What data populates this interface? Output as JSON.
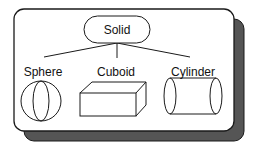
{
  "diagram": {
    "root": {
      "label": "Solid"
    },
    "children": [
      {
        "label": "Sphere",
        "shape": "sphere-icon"
      },
      {
        "label": "Cuboid",
        "shape": "cuboid-icon"
      },
      {
        "label": "Cylinder",
        "shape": "cylinder-icon"
      }
    ]
  },
  "colors": {
    "stroke": "#1a1a1a",
    "shadow": "#555555",
    "background": "#ffffff"
  }
}
